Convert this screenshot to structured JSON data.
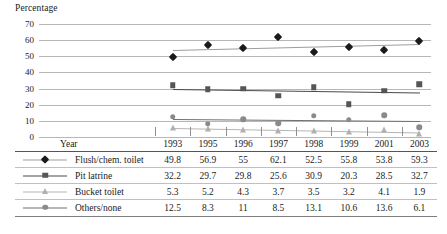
{
  "chart_data": {
    "type": "line",
    "title": "",
    "ylabel": "Percentage",
    "xlabel": "Year",
    "categories": [
      "1993",
      "1995",
      "1996",
      "1997",
      "1998",
      "1999",
      "2001",
      "2003"
    ],
    "ylim": [
      0,
      70
    ],
    "yticks": [
      0,
      10,
      20,
      30,
      40,
      50,
      60,
      70
    ],
    "grid": true,
    "legend_position": "table-left",
    "series": [
      {
        "name": "Flush/chem. toilet",
        "marker": "diamond",
        "color": "#1a1a1a",
        "line_color": "#9d9d9d",
        "values": [
          49.8,
          56.9,
          55,
          62.1,
          52.5,
          55.8,
          53.8,
          59.3
        ]
      },
      {
        "name": "Pit latrine",
        "marker": "square",
        "color": "#555555",
        "line_color": "#4a4a4a",
        "values": [
          32.2,
          29.7,
          29.8,
          25.6,
          30.9,
          20.3,
          28.5,
          32.7
        ]
      },
      {
        "name": "Bucket toilet",
        "marker": "triangle",
        "color": "#b0b0b0",
        "line_color": "#b5b5b5",
        "values": [
          5.3,
          5.2,
          4.3,
          3.7,
          3.5,
          3.2,
          4.1,
          1.9
        ]
      },
      {
        "name": "Others/none",
        "marker": "circle",
        "color": "#8a8a8a",
        "line_color": "#6f6f6f",
        "values": [
          12.5,
          8.3,
          11,
          8.5,
          13.1,
          10.6,
          13.6,
          6.1
        ]
      }
    ]
  },
  "axis": {
    "title": "Percentage",
    "yticks": [
      "70",
      "60",
      "50",
      "40",
      "30",
      "20",
      "10",
      "0"
    ]
  },
  "table": {
    "year_header": "Year",
    "years": [
      "1993",
      "1995",
      "1996",
      "1997",
      "1998",
      "1999",
      "2001",
      "2003"
    ],
    "rows": [
      {
        "label": "Flush/chem. toilet",
        "values": [
          "49.8",
          "56.9",
          "55",
          "62.1",
          "52.5",
          "55.8",
          "53.8",
          "59.3"
        ]
      },
      {
        "label": "Pit latrine",
        "values": [
          "32.2",
          "29.7",
          "29.8",
          "25.6",
          "30.9",
          "20.3",
          "28.5",
          "32.7"
        ]
      },
      {
        "label": "Bucket toilet",
        "values": [
          "5.3",
          "5.2",
          "4.3",
          "3.7",
          "3.5",
          "3.2",
          "4.1",
          "1.9"
        ]
      },
      {
        "label": "Others/none",
        "values": [
          "12.5",
          "8.3",
          "11",
          "8.5",
          "13.1",
          "10.6",
          "13.6",
          "6.1"
        ]
      }
    ]
  },
  "colors": {
    "gridline": "#b7b7b7",
    "text": "#1a1a1a",
    "rule": "#7d7d7d"
  }
}
